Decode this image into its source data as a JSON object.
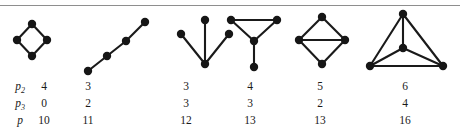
{
  "figure": {
    "rule_color": "#8e8e8e",
    "ink_color": "#161616"
  },
  "graphs": [
    {
      "name": "cycle-four-graph",
      "caption": "4-cycle",
      "nodes": [
        [
          32,
          24
        ],
        [
          17,
          40
        ],
        [
          47,
          40
        ],
        [
          32,
          56
        ]
      ],
      "edges": [
        [
          0,
          1
        ],
        [
          0,
          2
        ],
        [
          1,
          3
        ],
        [
          2,
          3
        ]
      ]
    },
    {
      "name": "path-four-graph",
      "caption": "path on 4 vertices",
      "nodes": [
        [
          88,
          71
        ],
        [
          107,
          56
        ],
        [
          126,
          41
        ],
        [
          145,
          22
        ]
      ],
      "edges": [
        [
          0,
          1
        ],
        [
          1,
          2
        ],
        [
          2,
          3
        ]
      ]
    },
    {
      "name": "star-three-graph",
      "caption": "star with three leaves",
      "nodes": [
        [
          205,
          64
        ],
        [
          181,
          34
        ],
        [
          205,
          20
        ],
        [
          229,
          34
        ]
      ],
      "edges": [
        [
          0,
          1
        ],
        [
          0,
          2
        ],
        [
          0,
          3
        ]
      ]
    },
    {
      "name": "paw-graph",
      "caption": "triangle with pendant vertex",
      "nodes": [
        [
          231,
          20
        ],
        [
          277,
          20
        ],
        [
          254,
          41
        ],
        [
          254,
          67
        ]
      ],
      "edges": [
        [
          0,
          1
        ],
        [
          0,
          2
        ],
        [
          1,
          2
        ],
        [
          2,
          3
        ]
      ]
    },
    {
      "name": "diamond-graph",
      "caption": "4-cycle with chord",
      "nodes": [
        [
          322,
          17
        ],
        [
          299,
          40
        ],
        [
          345,
          40
        ],
        [
          322,
          64
        ]
      ],
      "edges": [
        [
          0,
          1
        ],
        [
          0,
          2
        ],
        [
          1,
          2
        ],
        [
          1,
          3
        ],
        [
          2,
          3
        ]
      ]
    },
    {
      "name": "complete-four-graph",
      "caption": "complete graph on 4 vertices",
      "nodes": [
        [
          403,
          14
        ],
        [
          403,
          48
        ],
        [
          370,
          66
        ],
        [
          443,
          66
        ]
      ],
      "edges": [
        [
          0,
          1
        ],
        [
          0,
          2
        ],
        [
          0,
          3
        ],
        [
          1,
          2
        ],
        [
          1,
          3
        ],
        [
          2,
          3
        ]
      ]
    }
  ],
  "table": {
    "column_centers": [
      44,
      88,
      186,
      250,
      320,
      405
    ],
    "label_x": 20,
    "rows": [
      {
        "name": "p2",
        "label_base": "p",
        "label_sub": "2",
        "values": [
          "4",
          "3",
          "3",
          "4",
          "5",
          "6"
        ]
      },
      {
        "name": "p3",
        "label_base": "p",
        "label_sub": "3",
        "values": [
          "0",
          "2",
          "3",
          "3",
          "2",
          "4"
        ]
      },
      {
        "name": "p",
        "label_base": "p",
        "label_sub": "",
        "values": [
          "10",
          "11",
          "12",
          "13",
          "13",
          "16"
        ]
      }
    ]
  }
}
